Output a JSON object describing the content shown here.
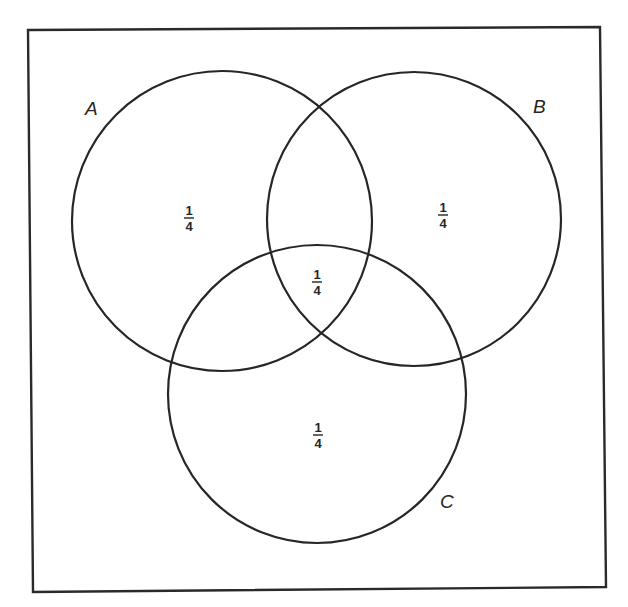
{
  "diagram": {
    "type": "venn",
    "universe": {
      "corners": [
        [
          28,
          30
        ],
        [
          600,
          27
        ],
        [
          606,
          587
        ],
        [
          33,
          592
        ]
      ],
      "stroke": "#2a2a2a"
    },
    "sets": [
      {
        "id": "A",
        "label": "A",
        "cx": 222,
        "cy": 221,
        "r": 150,
        "label_x": 85,
        "label_y": 115
      },
      {
        "id": "B",
        "label": "B",
        "cx": 414,
        "cy": 219,
        "r": 147,
        "label_x": 533,
        "label_y": 113
      },
      {
        "id": "C",
        "label": "C",
        "cx": 317,
        "cy": 394,
        "r": 149,
        "label_x": 440,
        "label_y": 508
      }
    ],
    "regions": [
      {
        "id": "A-only",
        "numerator": "1",
        "denominator": "4",
        "x": 189,
        "y": 218
      },
      {
        "id": "B-only",
        "numerator": "1",
        "denominator": "4",
        "x": 443,
        "y": 215
      },
      {
        "id": "A-B-C",
        "numerator": "1",
        "denominator": "4",
        "x": 317,
        "y": 282
      },
      {
        "id": "C-only",
        "numerator": "1",
        "denominator": "4",
        "x": 318,
        "y": 435
      }
    ],
    "stroke_color": "#262626",
    "background": "#ffffff"
  }
}
